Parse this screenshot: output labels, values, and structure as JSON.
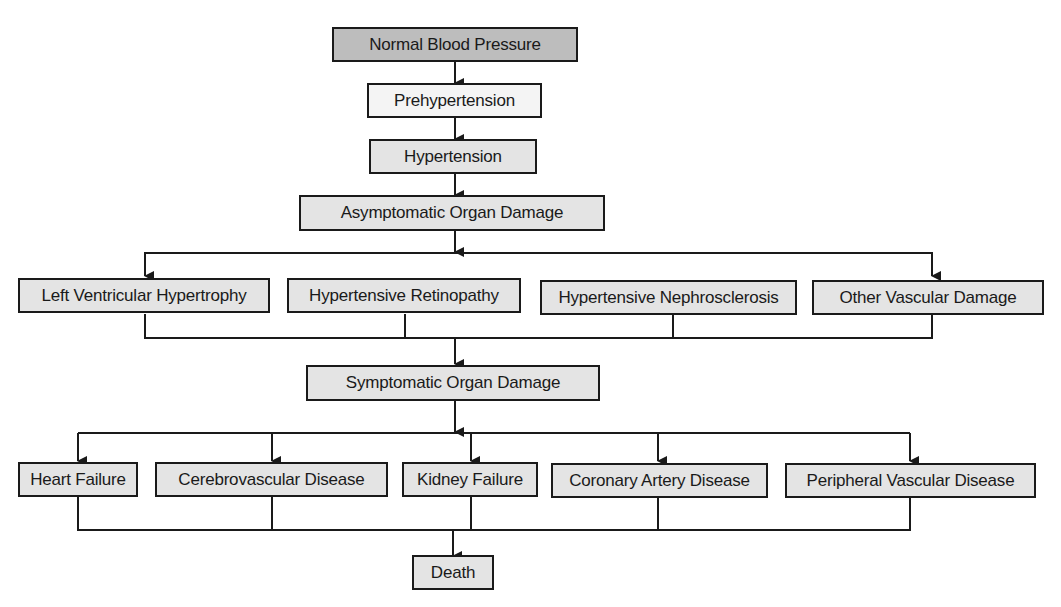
{
  "diagram": {
    "type": "flowchart",
    "colors": {
      "dark_box": "#bdbdbd",
      "light_box": "#e4e4e4",
      "white_box": "#f4f4f4",
      "line": "#1a1a1a"
    },
    "nodes": {
      "normal": "Normal Blood Pressure",
      "prehypertension": "Prehypertension",
      "hypertension": "Hypertension",
      "asymptomatic": "Asymptomatic Organ Damage",
      "lvh": "Left Ventricular Hypertrophy",
      "retinopathy": "Hypertensive Retinopathy",
      "nephrosclerosis": "Hypertensive Nephrosclerosis",
      "other_vascular": "Other Vascular Damage",
      "symptomatic": "Symptomatic Organ Damage",
      "heart_failure": "Heart Failure",
      "cerebrovascular": "Cerebrovascular Disease",
      "kidney_failure": "Kidney Failure",
      "coronary": "Coronary Artery Disease",
      "peripheral": "Peripheral Vascular Disease",
      "death": "Death"
    },
    "edges": [
      [
        "normal",
        "prehypertension"
      ],
      [
        "prehypertension",
        "hypertension"
      ],
      [
        "hypertension",
        "asymptomatic"
      ],
      [
        "asymptomatic",
        "lvh"
      ],
      [
        "asymptomatic",
        "other_vascular"
      ],
      [
        "lvh",
        "symptomatic"
      ],
      [
        "retinopathy",
        "symptomatic"
      ],
      [
        "nephrosclerosis",
        "symptomatic"
      ],
      [
        "other_vascular",
        "symptomatic"
      ],
      [
        "symptomatic",
        "heart_failure"
      ],
      [
        "symptomatic",
        "cerebrovascular"
      ],
      [
        "symptomatic",
        "kidney_failure"
      ],
      [
        "symptomatic",
        "coronary"
      ],
      [
        "symptomatic",
        "peripheral"
      ],
      [
        "heart_failure",
        "death"
      ],
      [
        "cerebrovascular",
        "death"
      ],
      [
        "kidney_failure",
        "death"
      ],
      [
        "coronary",
        "death"
      ],
      [
        "peripheral",
        "death"
      ]
    ]
  }
}
